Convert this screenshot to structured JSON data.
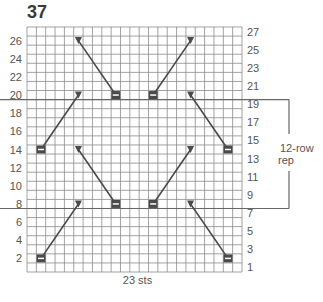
{
  "chart_number": "37",
  "grid": {
    "columns": 23,
    "rows": 27
  },
  "left_row_labels": [
    "26",
    "24",
    "22",
    "20",
    "18",
    "16",
    "14",
    "12",
    "10",
    "8",
    "6",
    "4",
    "2"
  ],
  "right_row_labels": [
    "27",
    "25",
    "23",
    "21",
    "19",
    "17",
    "15",
    "13",
    "11",
    "9",
    "7",
    "5",
    "3",
    "1"
  ],
  "stitch_count_label": "23 sts",
  "repeat": {
    "label_line1": "12-row",
    "label_line2": "rep",
    "from_row": 8,
    "to_row": 19
  },
  "colors": {
    "grid": "#8a8a8a",
    "symbol": "#4a4a4a",
    "text": "#555555"
  },
  "symbols": [
    {
      "type": "triangle",
      "row": 26,
      "col": 6
    },
    {
      "type": "rect",
      "row": 20,
      "col": 10
    },
    {
      "type": "rect",
      "row": 20,
      "col": 14
    },
    {
      "type": "triangle",
      "row": 26,
      "col": 18
    },
    {
      "type": "triangle",
      "row": 20,
      "col": 6
    },
    {
      "type": "rect",
      "row": 14,
      "col": 2
    },
    {
      "type": "triangle",
      "row": 20,
      "col": 18
    },
    {
      "type": "rect",
      "row": 14,
      "col": 22
    },
    {
      "type": "triangle",
      "row": 14,
      "col": 6
    },
    {
      "type": "rect",
      "row": 8,
      "col": 10
    },
    {
      "type": "triangle",
      "row": 14,
      "col": 18
    },
    {
      "type": "rect",
      "row": 8,
      "col": 14
    },
    {
      "type": "triangle",
      "row": 8,
      "col": 6
    },
    {
      "type": "rect",
      "row": 2,
      "col": 2
    },
    {
      "type": "triangle",
      "row": 8,
      "col": 18
    },
    {
      "type": "rect",
      "row": 2,
      "col": 22
    }
  ],
  "lines": [
    [
      26,
      6,
      20,
      10
    ],
    [
      26,
      18,
      20,
      14
    ],
    [
      20,
      6,
      14,
      2
    ],
    [
      20,
      18,
      14,
      22
    ],
    [
      14,
      6,
      8,
      10
    ],
    [
      14,
      18,
      8,
      14
    ],
    [
      8,
      6,
      2,
      2
    ],
    [
      8,
      18,
      2,
      22
    ]
  ]
}
